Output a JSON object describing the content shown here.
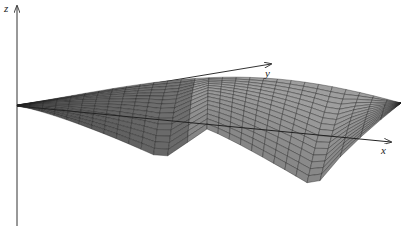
{
  "figure": {
    "axes": {
      "x": {
        "label": "x"
      },
      "y": {
        "label": "y"
      },
      "z": {
        "label": "z"
      }
    },
    "colors": {
      "background": "#ffffff",
      "axis": "#333333",
      "surface_dark": "#4a4a4a",
      "surface_light": "#8c8c8c",
      "grid": "#1e1e1e"
    },
    "surface": {
      "grid_rows": 16,
      "grid_cols": 28
    }
  }
}
